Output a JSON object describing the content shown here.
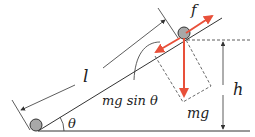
{
  "diagram": {
    "labels": {
      "length": "l",
      "friction": "f",
      "height": "h",
      "angle": "θ",
      "weight": "mg",
      "component": "mg sin θ"
    },
    "colors": {
      "force_arrow": "#e8503a",
      "line": "#333333",
      "ball_fill": "#a8a8a8"
    }
  }
}
